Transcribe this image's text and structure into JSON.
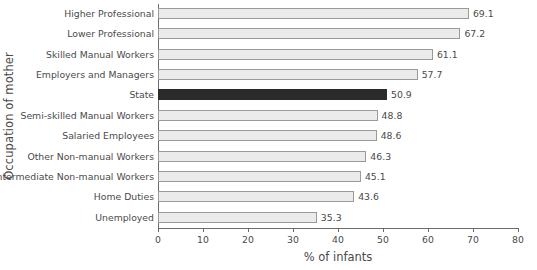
{
  "chart_data": {
    "type": "bar",
    "orientation": "horizontal",
    "title": "",
    "xlabel": "% of infants",
    "ylabel": "Occupation of mother",
    "xlim": [
      0,
      80
    ],
    "xticks": [
      0,
      10,
      20,
      30,
      40,
      50,
      60,
      70,
      80
    ],
    "grid": false,
    "legend": null,
    "highlight_category": "State",
    "colors": {
      "bar_fill": "#ebebeb",
      "bar_outline": "#9a9a9a",
      "highlight_fill": "#2b2b2b",
      "axis": "#6b6b6b",
      "text": "#4a4a4a",
      "background": "#ffffff"
    },
    "categories": [
      "Higher Professional",
      "Lower Professional",
      "Skilled Manual Workers",
      "Employers and Managers",
      "State",
      "Semi-skilled Manual Workers",
      "Salaried Employees",
      "Other Non-manual Workers",
      "Intermediate Non-manual Workers",
      "Home Duties",
      "Unemployed"
    ],
    "values": [
      69.1,
      67.2,
      61.1,
      57.7,
      50.9,
      48.8,
      48.6,
      46.3,
      45.1,
      43.6,
      35.3
    ],
    "value_labels": [
      "69.1",
      "67.2",
      "61.1",
      "57.7",
      "50.9",
      "48.8",
      "48.6",
      "46.3",
      "45.1",
      "43.6",
      "35.3"
    ],
    "xtick_labels": [
      "0",
      "10",
      "20",
      "30",
      "40",
      "50",
      "60",
      "70",
      "80"
    ]
  }
}
